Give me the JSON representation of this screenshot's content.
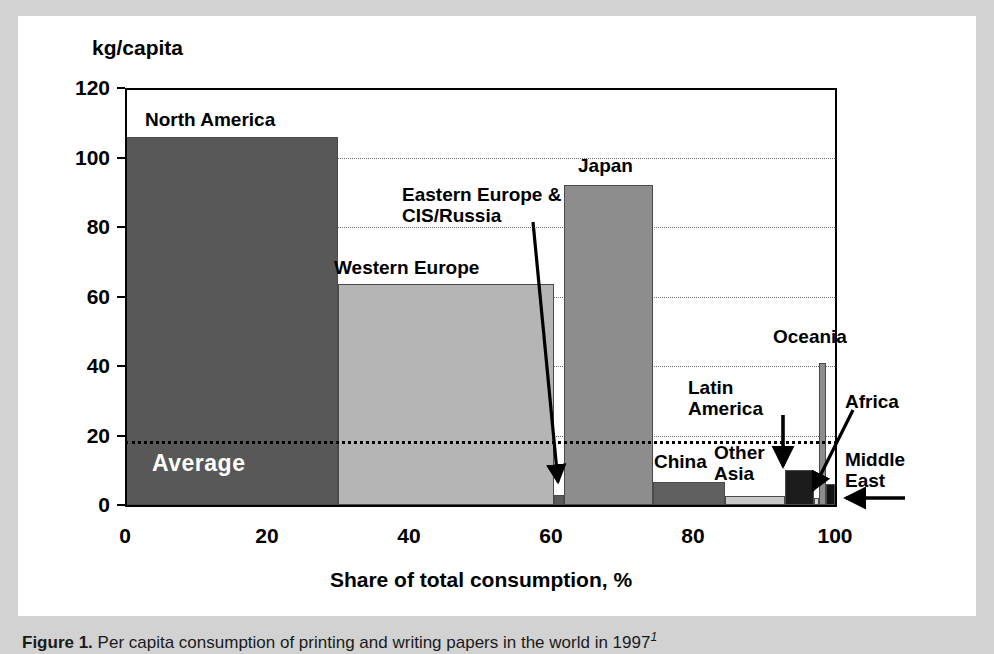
{
  "figure": {
    "caption_label": "Figure 1.",
    "caption_text": "Per capita consumption of printing and writing papers in the world in 1997",
    "caption_footnote": "1"
  },
  "chart_data": {
    "type": "bar",
    "title": "",
    "xlabel": "Share of total consumption, %",
    "ylabel": "kg/capita",
    "xlim": [
      0,
      100
    ],
    "ylim": [
      0,
      120
    ],
    "ytick_labels": [
      "0",
      "20",
      "40",
      "60",
      "80",
      "100",
      "120"
    ],
    "yticks": [
      0,
      20,
      40,
      60,
      80,
      100,
      120
    ],
    "xtick_labels": [
      "0",
      "20",
      "40",
      "60",
      "80",
      "100"
    ],
    "xticks": [
      0,
      20,
      40,
      60,
      80,
      100
    ],
    "grid": "horizontal-dotted",
    "legend": "none",
    "note": "Variable-width (Marimekko) bar chart: bar width = share of total consumption (%), bar height = per capita consumption (kg/capita)",
    "categories": [
      {
        "name": "North America",
        "value": 106,
        "share_start": 0,
        "share_end": 30,
        "color": "#585858",
        "label_x": 145,
        "label_y": 110,
        "label_align": "left"
      },
      {
        "name": "Western Europe",
        "value": 63.5,
        "share_start": 30,
        "share_end": 60.4,
        "color": "#b5b5b5",
        "label_x": 334,
        "label_y": 258,
        "label_align": "left"
      },
      {
        "name": "Eastern Europe &\nCIS/Russia",
        "value": 3,
        "share_start": 60.4,
        "share_end": 61.8,
        "color": "#5a5a5a",
        "label_x": 402,
        "label_y": 185,
        "label_align": "left"
      },
      {
        "name": "Japan",
        "value": 92,
        "share_start": 61.8,
        "share_end": 74.4,
        "color": "#8d8d8d",
        "label_x": 578,
        "label_y": 156,
        "label_align": "left"
      },
      {
        "name": "China",
        "value": 6.5,
        "share_start": 74.4,
        "share_end": 84.5,
        "color": "#5f5f5f",
        "label_x": 654,
        "label_y": 452,
        "label_align": "left"
      },
      {
        "name": "Other\nAsia",
        "value": 2.5,
        "share_start": 84.5,
        "share_end": 93.0,
        "color": "#c9c9c9",
        "label_x": 714,
        "label_y": 443,
        "label_align": "left"
      },
      {
        "name": "Latin\nAmerica",
        "value": 10,
        "share_start": 93.0,
        "share_end": 97.0,
        "color": "#1c1c1c",
        "label_x": 688,
        "label_y": 378,
        "label_align": "left"
      },
      {
        "name": "Africa",
        "value": 2,
        "share_start": 97.0,
        "share_end": 97.7,
        "color": "#d8d8d8",
        "label_x": 845,
        "label_y": 392,
        "label_align": "left"
      },
      {
        "name": "Oceania",
        "value": 41,
        "share_start": 97.7,
        "share_end": 98.8,
        "color": "#8d8d8d",
        "label_x": 773,
        "label_y": 327,
        "label_align": "left"
      },
      {
        "name": "Middle\nEast",
        "value": 6,
        "share_start": 98.8,
        "share_end": 100,
        "color": "#141414",
        "label_x": 845,
        "label_y": 450,
        "label_align": "left"
      }
    ],
    "reference_line": {
      "name": "Average",
      "value": 18.5,
      "label": "Average",
      "style": "dotted",
      "color": "#000000",
      "label_x": 152,
      "label_y": 450
    }
  }
}
